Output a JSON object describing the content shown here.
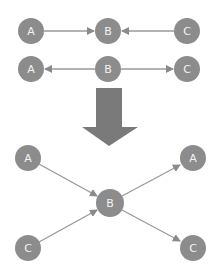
{
  "diagram": {
    "top_row1": {
      "nodes": [
        {
          "label": "A",
          "x": 31,
          "y": 31
        },
        {
          "label": "B",
          "x": 108,
          "y": 31
        },
        {
          "label": "C",
          "x": 187,
          "y": 31
        }
      ],
      "edges": [
        {
          "from": "A",
          "to": "B"
        },
        {
          "from": "C",
          "to": "B"
        }
      ]
    },
    "top_row2": {
      "nodes": [
        {
          "label": "A",
          "x": 31,
          "y": 69
        },
        {
          "label": "B",
          "x": 108,
          "y": 69
        },
        {
          "label": "C",
          "x": 187,
          "y": 69
        }
      ],
      "edges": [
        {
          "from": "B",
          "to": "A"
        },
        {
          "from": "B",
          "to": "C"
        }
      ]
    },
    "transform_arrow": {
      "direction": "down",
      "color": "#7a7a7a"
    },
    "bottom": {
      "nodes": [
        {
          "label": "A",
          "x": 28,
          "y": 158
        },
        {
          "label": "C",
          "x": 28,
          "y": 248
        },
        {
          "label": "B",
          "x": 110,
          "y": 203
        },
        {
          "label": "A",
          "x": 193,
          "y": 158
        },
        {
          "label": "C",
          "x": 193,
          "y": 248
        }
      ],
      "edges": [
        {
          "from": "A(left)",
          "to": "B"
        },
        {
          "from": "C(left)",
          "to": "B"
        },
        {
          "from": "B",
          "to": "A(right)"
        },
        {
          "from": "B",
          "to": "C(right)"
        }
      ]
    },
    "colors": {
      "node": "#8c8c8c",
      "edge": "#9a9a9a",
      "label": "#f4f4f4"
    }
  }
}
